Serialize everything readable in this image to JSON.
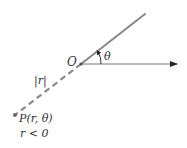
{
  "diagram": {
    "colors": {
      "ray": "#8a8a8a",
      "axis": "#6a6a6a",
      "text": "#333333",
      "point": "#6a6a6a"
    },
    "labels": {
      "origin": "O",
      "angle": "θ",
      "abs_r": "|r|",
      "point": "P(r, θ)",
      "condition": "r < 0"
    },
    "geometry": {
      "origin": [
        81,
        64
      ],
      "ray_end": [
        145,
        14
      ],
      "polar_axis_end": [
        178,
        64
      ],
      "point_p": [
        15,
        115
      ]
    }
  }
}
